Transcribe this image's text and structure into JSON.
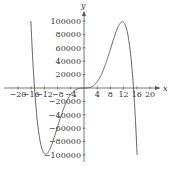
{
  "chart_data": {
    "type": "line",
    "title": "",
    "xlabel": "x",
    "ylabel": "y",
    "xlim": [
      -22,
      22
    ],
    "ylim": [
      -105000,
      105000
    ],
    "grid": false,
    "legend": null,
    "x_ticks": [
      -20,
      -16,
      -12,
      -8,
      -4,
      4,
      8,
      12,
      16,
      20
    ],
    "x_tick_labels": [
      "−20",
      "−16",
      "−12",
      "−8",
      "−4",
      "4",
      "8",
      "12",
      "16",
      "20"
    ],
    "y_ticks": [
      100000,
      80000,
      60000,
      40000,
      20000,
      -20000,
      -40000,
      -60000,
      -80000,
      -100000
    ],
    "y_tick_labels": [
      "100000",
      "80000",
      "60000",
      "40000",
      "20000",
      "−20000",
      "−40000",
      "−60000",
      "−80000",
      "−100000"
    ],
    "series": [
      {
        "name": "f(x)",
        "x": [
          -16.5,
          -15,
          -14,
          -13,
          -12,
          -11,
          -10,
          -8,
          -6,
          -4,
          -2,
          0,
          2,
          4,
          6,
          8,
          10,
          11,
          12,
          13,
          14,
          15,
          16,
          17.5
        ],
        "y": [
          -100000,
          0,
          40000,
          82000,
          97000,
          98000,
          87000,
          54000,
          28000,
          9000,
          1000,
          0,
          -1000,
          -9000,
          -28000,
          -54000,
          -87000,
          -98000,
          -97000,
          -82000,
          -40000,
          0,
          60000,
          100000
        ]
      }
    ],
    "color": "#444444"
  }
}
